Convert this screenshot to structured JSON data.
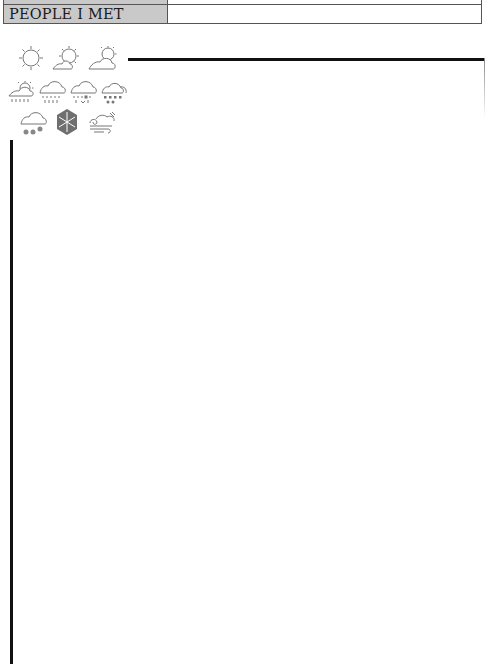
{
  "header": {
    "rows": [
      {
        "label": "",
        "value": ""
      },
      {
        "label": "PEOPLE I MET",
        "value": ""
      }
    ]
  },
  "weather_icons": [
    {
      "name": "sunny-icon"
    },
    {
      "name": "partly-sunny-icon"
    },
    {
      "name": "mostly-cloudy-sun-icon"
    },
    {
      "name": "sun-showers-icon"
    },
    {
      "name": "rain-icon"
    },
    {
      "name": "sleet-icon"
    },
    {
      "name": "hail-icon"
    },
    {
      "name": "snow-icon"
    },
    {
      "name": "snowflake-icon"
    },
    {
      "name": "windy-icon"
    }
  ],
  "colors": {
    "label_bg": "#c9c9c9",
    "line": "#111111",
    "icon_stroke": "#777777"
  }
}
